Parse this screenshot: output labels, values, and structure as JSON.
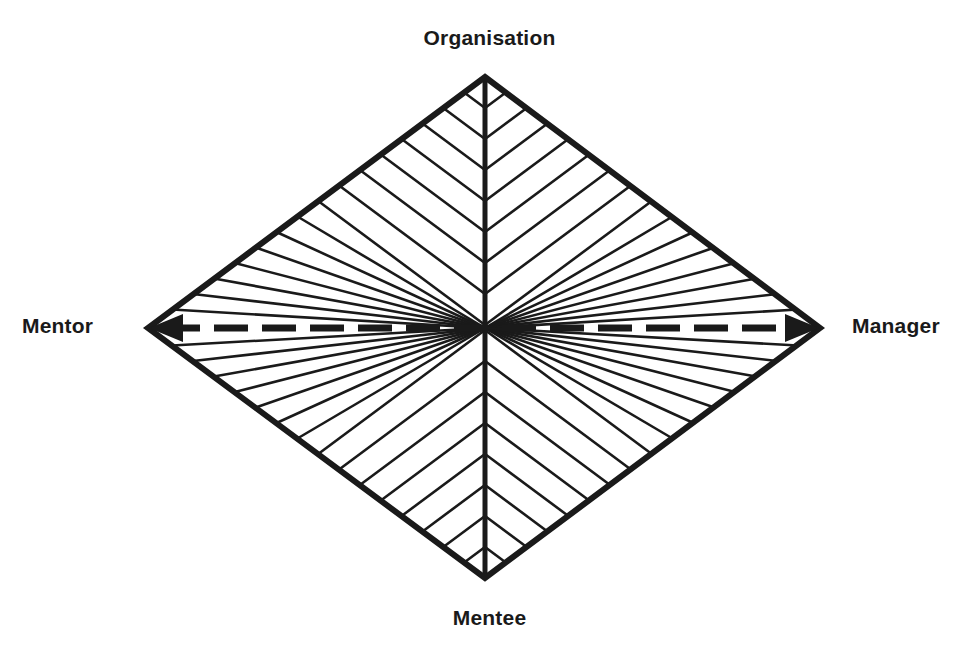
{
  "diagram": {
    "type": "diamond-quadrant-model",
    "title": "",
    "labels": {
      "top": "Organisation",
      "bottom": "Mentee",
      "left": "Mentor",
      "right": "Manager"
    },
    "colors": {
      "stroke": "#1a1a1a",
      "background": "#ffffff",
      "text": "#1a1a1a"
    },
    "geometry": {
      "top_vertex": [
        485,
        77
      ],
      "bottom_vertex": [
        485,
        578
      ],
      "left_vertex": [
        148,
        328
      ],
      "right_vertex": [
        820,
        328
      ],
      "outline_width": 6,
      "hatch_width": 2.6,
      "center_vertical_width": 5,
      "center_horizontal_width": 7
    },
    "center_horizontal": {
      "style": "dashed",
      "dash": "34 14",
      "arrowheads": "both"
    },
    "center_vertical": {
      "style": "solid",
      "arrowheads": "none"
    },
    "hatching": {
      "description": "chevron lines in each quadrant parallel to the adjacent outer edge, converging on the vertical centre line",
      "lines_per_half": 8,
      "spacing_px": 31
    }
  }
}
